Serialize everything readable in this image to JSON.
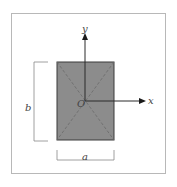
{
  "diagram": {
    "type": "cross-section",
    "shape": "rectangle",
    "labels": {
      "y_axis": "y",
      "x_axis": "x",
      "origin": "O",
      "height_dim": "b",
      "width_dim": "a"
    },
    "colors": {
      "fill": "#8c8c8c",
      "outline": "#3a3a3a",
      "axis": "#2a2a2a",
      "frame": "#b8b8b8",
      "dimension": "#888888",
      "diagonal": "#6a6a6a"
    }
  }
}
